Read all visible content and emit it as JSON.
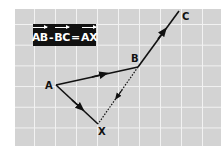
{
  "equation": {
    "term1": "AB",
    "op1": "-",
    "term2": "BC",
    "op2": "=",
    "result": "AX"
  },
  "points": {
    "A": {
      "label": "A",
      "x": 56,
      "y": 85
    },
    "B": {
      "label": "B",
      "x": 138,
      "y": 67
    },
    "C": {
      "label": "C",
      "x": 179,
      "y": 11
    },
    "X": {
      "label": "X",
      "x": 98,
      "y": 124
    }
  },
  "vectors": [
    {
      "from": "A",
      "to": "B",
      "style": "solid"
    },
    {
      "from": "B",
      "to": "C",
      "style": "solid"
    },
    {
      "from": "A",
      "to": "X",
      "style": "solid"
    },
    {
      "from": "B",
      "to": "X",
      "style": "dotted",
      "note": "negative BC"
    }
  ],
  "colors": {
    "grid_background": "#d3d3d3",
    "grid_lines": "#f2f2f2",
    "label_box": "#111111",
    "vector": "#111111"
  }
}
